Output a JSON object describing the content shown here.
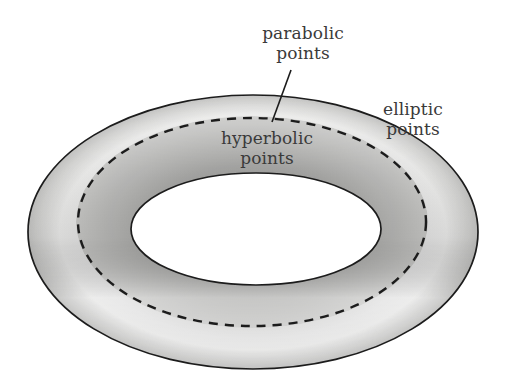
{
  "figure": {
    "type": "torus-curvature-diagram",
    "background_color": "#ffffff",
    "outline_color": "#1c1c1c",
    "text_color": "#3a3a3a",
    "surface_light": "#eeeeec",
    "surface_mid": "#d0d0ce",
    "surface_dark": "#9d9d9b"
  },
  "labels": {
    "parabolic": {
      "line1": "parabolic",
      "line2": "points"
    },
    "elliptic": {
      "line1": "elliptic",
      "line2": "points"
    },
    "hyperbolic": {
      "line1": "hyperbolic",
      "line2": "points"
    }
  },
  "geometry": {
    "outer_ellipse": {
      "cx": 253,
      "cy": 232,
      "rx": 225,
      "ry": 137
    },
    "inner_hole_ellipse": {
      "cx": 256,
      "cy": 229,
      "rx": 125,
      "ry": 56
    },
    "dashed_parabolic_ellipse": {
      "cx": 252,
      "cy": 222,
      "rx": 174,
      "ry": 104
    },
    "leader_line": {
      "x1": 291,
      "y1": 70,
      "x2": 272,
      "y2": 122
    }
  }
}
